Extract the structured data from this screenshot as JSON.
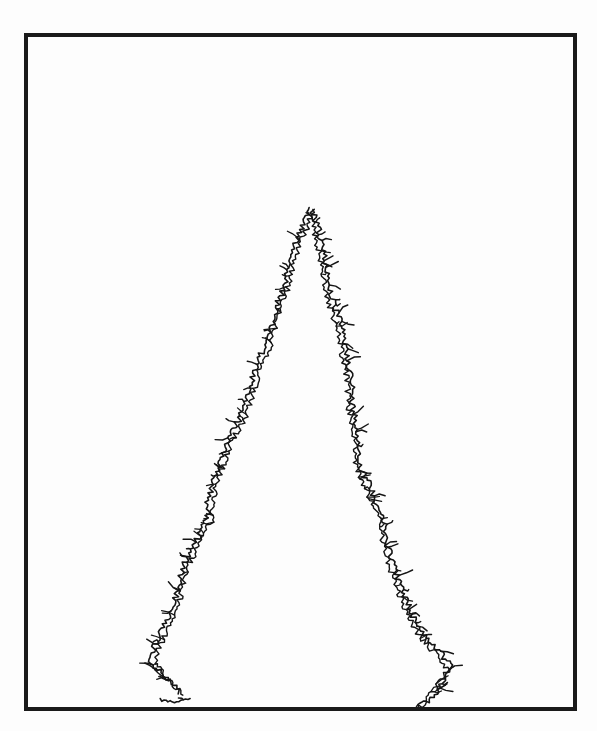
{
  "figure": {
    "frame": {
      "x": 26,
      "y": 35,
      "width": 549,
      "height": 674,
      "stroke": "#1a1a1a",
      "stroke_width": 4
    },
    "stroke_color": "#151515",
    "left_branch": [
      [
        310,
        208
      ],
      [
        304,
        222
      ],
      [
        298,
        238
      ],
      [
        292,
        255
      ],
      [
        287,
        272
      ],
      [
        283,
        290
      ],
      [
        276,
        308
      ],
      [
        271,
        328
      ],
      [
        266,
        345
      ],
      [
        257,
        362
      ],
      [
        252,
        380
      ],
      [
        246,
        400
      ],
      [
        240,
        418
      ],
      [
        228,
        438
      ],
      [
        222,
        458
      ],
      [
        214,
        478
      ],
      [
        208,
        500
      ],
      [
        207,
        520
      ],
      [
        196,
        542
      ],
      [
        183,
        565
      ],
      [
        178,
        585
      ],
      [
        174,
        605
      ],
      [
        165,
        625
      ],
      [
        155,
        645
      ],
      [
        150,
        662
      ],
      [
        165,
        678
      ],
      [
        180,
        692
      ]
    ],
    "left_stub": [
      [
        160,
        700
      ],
      [
        172,
        702
      ],
      [
        190,
        698
      ]
    ],
    "right_branch": [
      [
        312,
        210
      ],
      [
        318,
        228
      ],
      [
        322,
        245
      ],
      [
        326,
        265
      ],
      [
        329,
        285
      ],
      [
        334,
        305
      ],
      [
        340,
        322
      ],
      [
        345,
        345
      ],
      [
        349,
        365
      ],
      [
        352,
        385
      ],
      [
        352,
        405
      ],
      [
        357,
        425
      ],
      [
        359,
        445
      ],
      [
        360,
        465
      ],
      [
        368,
        482
      ],
      [
        376,
        500
      ],
      [
        383,
        518
      ],
      [
        386,
        538
      ],
      [
        392,
        558
      ],
      [
        398,
        578
      ],
      [
        405,
        598
      ],
      [
        414,
        618
      ],
      [
        425,
        636
      ],
      [
        440,
        652
      ],
      [
        452,
        668
      ],
      [
        440,
        685
      ],
      [
        430,
        700
      ],
      [
        418,
        708
      ]
    ]
  }
}
